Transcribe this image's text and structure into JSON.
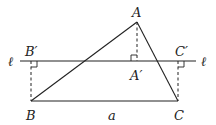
{
  "diagram": {
    "type": "geometry",
    "points": {
      "A": {
        "label": "A",
        "x": 137,
        "y": 22
      },
      "B": {
        "label": "B",
        "x": 31,
        "y": 101
      },
      "C": {
        "label": "C",
        "x": 178,
        "y": 101
      },
      "A_prime": {
        "label": "A′",
        "x": 137,
        "y": 61
      },
      "B_prime": {
        "label": "B′",
        "x": 31,
        "y": 61
      },
      "C_prime": {
        "label": "C′",
        "x": 178,
        "y": 61
      }
    },
    "line": {
      "label_left": "ℓ",
      "label_right": "ℓ",
      "y": 61,
      "x1": 20,
      "x2": 196
    },
    "side_label": "a"
  }
}
